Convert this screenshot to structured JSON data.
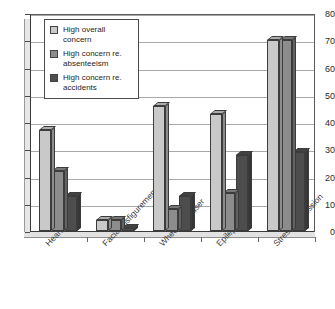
{
  "chart_data": {
    "type": "bar",
    "title": "",
    "subtitle": "",
    "xlabel": "",
    "ylabel": "",
    "ylim": [
      0,
      80
    ],
    "ytick_step": 10,
    "yticks": [
      0,
      10,
      20,
      30,
      40,
      50,
      60,
      70,
      80
    ],
    "grid": true,
    "grid_axis": "y",
    "legend_position": "upper-left-inside",
    "orientation": "vertical",
    "style": "3d-grouped-bars",
    "categories": [
      "Heart attack",
      "Facial disfigurement",
      "Wheelchair user",
      "Epilepsy",
      "Stress/depression"
    ],
    "series": [
      {
        "name": "High overall concern",
        "color": "#c9c9c9",
        "values": [
          37,
          4,
          46,
          43,
          70
        ]
      },
      {
        "name": "High concern re. absenteeism",
        "color": "#8c8c8c",
        "values": [
          22,
          4,
          8,
          14,
          70
        ]
      },
      {
        "name": "High concern re. accidents",
        "color": "#4d4d4d",
        "values": [
          13,
          1,
          13,
          28,
          29
        ]
      }
    ]
  },
  "legend": {
    "items": [
      {
        "label": "High overall\nconcern",
        "color": "#c9c9c9"
      },
      {
        "label": "High concern re.\nabsenteeism",
        "color": "#8c8c8c"
      },
      {
        "label": "High concern re.\naccidents",
        "color": "#4d4d4d"
      }
    ]
  },
  "colors": {
    "series_light": "#c9c9c9",
    "series_medium": "#8c8c8c",
    "series_dark": "#4d4d4d",
    "axis": "#3b3b3b",
    "gridline": "#a9a9a9",
    "background": "#ffffff",
    "text": "#2b2b2b"
  }
}
